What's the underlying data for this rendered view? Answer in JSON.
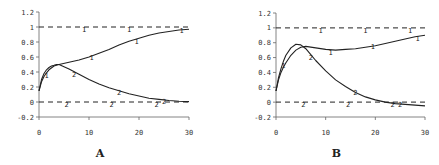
{
  "chart_data": [
    {
      "type": "line",
      "panel_label": "A",
      "xlim": [
        0,
        30
      ],
      "ylim": [
        -0.2,
        1.2
      ],
      "xticks": [
        0,
        10,
        20,
        30
      ],
      "yticks": [
        -0.2,
        0,
        0.2,
        0.4,
        0.6,
        0.8,
        1,
        1.2
      ],
      "ytick_labels": [
        "-0.2",
        "0",
        "0.2",
        "0.4",
        "0.6",
        "0.8",
        "1",
        "1.2"
      ],
      "xtick_labels": [
        "0",
        "10",
        "20",
        "30"
      ],
      "grid": false,
      "frame": {
        "x0": 39,
        "x1": 189,
        "y_top": 12,
        "y_bottom": 117,
        "ymin": -0.2,
        "ymax": 1.2
      },
      "series": [
        {
          "name": "1",
          "style": "solid",
          "x": [
            0,
            0.5,
            1,
            1.5,
            2,
            3,
            4,
            6,
            8,
            10,
            12,
            14,
            16,
            18,
            20,
            22,
            24,
            26,
            28,
            30
          ],
          "y": [
            0.15,
            0.27,
            0.34,
            0.39,
            0.43,
            0.48,
            0.5,
            0.53,
            0.56,
            0.6,
            0.65,
            0.7,
            0.76,
            0.81,
            0.85,
            0.89,
            0.92,
            0.94,
            0.96,
            0.97
          ]
        },
        {
          "name": "2",
          "style": "solid",
          "x": [
            0,
            0.5,
            1,
            1.5,
            2,
            2.5,
            3,
            3.5,
            4,
            6,
            8,
            10,
            12,
            14,
            16,
            18,
            20,
            22,
            24,
            26,
            28,
            30
          ],
          "y": [
            0.15,
            0.3,
            0.38,
            0.43,
            0.46,
            0.48,
            0.49,
            0.5,
            0.5,
            0.44,
            0.37,
            0.3,
            0.24,
            0.19,
            0.15,
            0.11,
            0.08,
            0.05,
            0.035,
            0.02,
            0.01,
            0.005
          ]
        },
        {
          "name": "1-asymptote",
          "style": "dashed",
          "x": [
            0,
            30
          ],
          "y": [
            1,
            1
          ]
        },
        {
          "name": "2-asymptote",
          "style": "dashed",
          "x": [
            0,
            30
          ],
          "y": [
            0,
            0
          ]
        }
      ],
      "markers": [
        {
          "label": "1",
          "x": 1.5,
          "y": 0.36
        },
        {
          "label": "1",
          "x": 9,
          "y": 0.97
        },
        {
          "label": "1",
          "x": 18,
          "y": 0.97
        },
        {
          "label": "1",
          "x": 28.5,
          "y": 0.96
        },
        {
          "label": "1",
          "x": 10.5,
          "y": 0.6
        },
        {
          "label": "1",
          "x": 19.5,
          "y": 0.82
        },
        {
          "label": "2",
          "x": 7,
          "y": 0.37
        },
        {
          "label": "2",
          "x": 16,
          "y": 0.14
        },
        {
          "label": "2",
          "x": 25,
          "y": 0.02
        },
        {
          "label": "2",
          "x": 5.5,
          "y": -0.03
        },
        {
          "label": "2",
          "x": 14.5,
          "y": -0.03
        },
        {
          "label": "2",
          "x": 23.5,
          "y": -0.03
        }
      ]
    },
    {
      "type": "line",
      "panel_label": "B",
      "xlim": [
        0,
        30
      ],
      "ylim": [
        -0.2,
        1.2
      ],
      "xticks": [
        0,
        10,
        20,
        30
      ],
      "yticks": [
        -0.2,
        0,
        0.2,
        0.4,
        0.6,
        0.8,
        1,
        1.2
      ],
      "ytick_labels": [
        "-0.2",
        "0",
        "0.2",
        "0.4",
        "0.6",
        "0.8",
        "1",
        "1.2"
      ],
      "xtick_labels": [
        "0",
        "10",
        "20",
        "30"
      ],
      "grid": false,
      "frame": {
        "x0": 276,
        "x1": 425,
        "y_top": 13,
        "y_bottom": 117,
        "ymin": -0.2,
        "ymax": 1.2
      },
      "series": [
        {
          "name": "1",
          "style": "solid",
          "x": [
            0,
            0.5,
            1,
            1.5,
            2,
            3,
            4,
            5,
            6,
            8,
            10,
            12,
            14,
            16,
            18,
            20,
            22,
            24,
            26,
            28,
            30
          ],
          "y": [
            0.15,
            0.3,
            0.4,
            0.47,
            0.53,
            0.63,
            0.7,
            0.74,
            0.75,
            0.73,
            0.71,
            0.7,
            0.71,
            0.72,
            0.74,
            0.76,
            0.79,
            0.82,
            0.85,
            0.88,
            0.9
          ]
        },
        {
          "name": "2",
          "style": "solid",
          "x": [
            0,
            0.5,
            1,
            1.5,
            2,
            3,
            4,
            5,
            6,
            7,
            8,
            10,
            12,
            14,
            16,
            18,
            20,
            22,
            24,
            26,
            28,
            30
          ],
          "y": [
            0.15,
            0.33,
            0.45,
            0.55,
            0.63,
            0.73,
            0.78,
            0.77,
            0.72,
            0.64,
            0.56,
            0.42,
            0.3,
            0.21,
            0.13,
            0.07,
            0.03,
            0.0,
            -0.02,
            -0.03,
            -0.04,
            -0.05
          ]
        },
        {
          "name": "1-asymptote",
          "style": "dashed",
          "x": [
            0,
            30
          ],
          "y": [
            1,
            1
          ]
        },
        {
          "name": "2-asymptote",
          "style": "dashed",
          "x": [
            0,
            30
          ],
          "y": [
            0,
            0
          ]
        }
      ],
      "markers": [
        {
          "label": "1",
          "x": 9,
          "y": 0.97
        },
        {
          "label": "1",
          "x": 18,
          "y": 0.97
        },
        {
          "label": "1",
          "x": 27,
          "y": 0.97
        },
        {
          "label": "1",
          "x": 11,
          "y": 0.68
        },
        {
          "label": "1",
          "x": 19.5,
          "y": 0.76
        },
        {
          "label": "1",
          "x": 28.5,
          "y": 0.86
        },
        {
          "label": "1",
          "x": 1.5,
          "y": 0.5
        },
        {
          "label": "2",
          "x": 7,
          "y": 0.61
        },
        {
          "label": "2",
          "x": 16,
          "y": 0.14
        },
        {
          "label": "2",
          "x": 5.5,
          "y": -0.03
        },
        {
          "label": "2",
          "x": 14.5,
          "y": -0.03
        },
        {
          "label": "2",
          "x": 23.5,
          "y": -0.03
        },
        {
          "label": "2",
          "x": 25,
          "y": -0.03
        }
      ]
    }
  ]
}
